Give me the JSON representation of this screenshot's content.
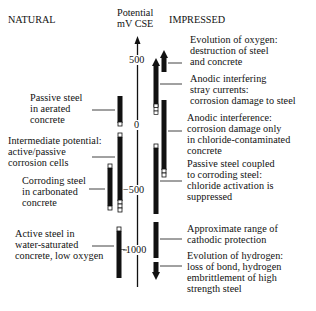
{
  "headers": {
    "natural": "NATURAL",
    "potential_line1": "Potential",
    "potential_line2": "mV CSE",
    "impressed": "IMPRESSED"
  },
  "axis": {
    "ticks": [
      {
        "value": 500,
        "label": "500"
      },
      {
        "value": 0,
        "label": "0"
      },
      {
        "value": -500,
        "label": "−500"
      },
      {
        "value": -1000,
        "label": "−1000"
      }
    ]
  },
  "natural": [
    {
      "lines": [
        "Passive steel",
        "in aerated",
        "concrete"
      ]
    },
    {
      "lines": [
        "Intermediate potential:",
        "active/passive",
        "corrosion cells"
      ]
    },
    {
      "lines": [
        "Corroding steel",
        "in carbonated",
        "concrete"
      ]
    },
    {
      "lines": [
        "Active steel in",
        "water-saturated",
        "concrete, low oxygen"
      ]
    }
  ],
  "impressed": [
    {
      "lines": [
        "Evolution of oxygen:",
        "destruction of steel",
        "and concrete"
      ]
    },
    {
      "lines": [
        "Anodic interfering",
        "stray currents:",
        "corrosion damage to steel"
      ]
    },
    {
      "lines": [
        "Anodic interference:",
        "corrosion damage only",
        "in chloride-contaminated",
        "concrete"
      ]
    },
    {
      "lines": [
        "Passive steel coupled",
        "to corroding steel:",
        "chloride activation is",
        "suppressed"
      ]
    },
    {
      "lines": [
        "Approximate range of",
        "cathodic protection"
      ]
    },
    {
      "lines": [
        "Evolution of hydrogen:",
        "loss of bond, hydrogen",
        "embrittlement of high",
        "strength steel"
      ]
    }
  ],
  "colors": {
    "ink": "#111111",
    "background": "#ffffff"
  }
}
